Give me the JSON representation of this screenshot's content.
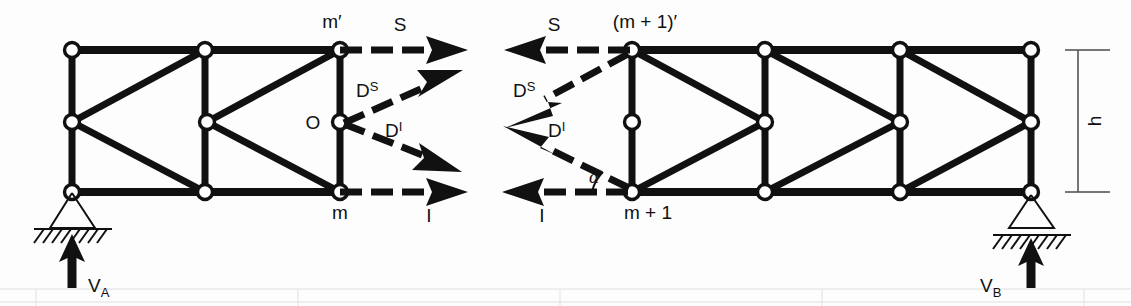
{
  "figure": {
    "type": "truss-free-body-diagram",
    "background_color": "#fdfdfd",
    "ink_color": "#111111"
  },
  "labels": {
    "node_m_top": "m′",
    "node_m_bottom": "m",
    "node_o": "O",
    "node_mp1_top": "(m + 1)′",
    "node_mp1_bottom": "m + 1",
    "force_s_left": "S",
    "force_s_right": "S",
    "force_i_left": "I",
    "force_i_right": "I",
    "force_ds_left": "D",
    "force_ds_left_sup": "S",
    "force_di_left": "D",
    "force_di_left_sup": "I",
    "force_ds_right": "D",
    "force_ds_right_sup": "S",
    "force_di_right": "D",
    "force_di_right_sup": "I",
    "angle_alpha": "α",
    "reaction_a": "V",
    "reaction_a_sub": "A",
    "reaction_b": "V",
    "reaction_b_sub": "B",
    "height_dim": "h"
  },
  "geometry": {
    "left_truss": {
      "top_chord_y": 50,
      "mid_y": 122,
      "bottom_chord_y": 192,
      "panel_x": [
        72,
        205,
        340
      ],
      "top_nodes": [
        [
          72,
          50
        ],
        [
          205,
          50
        ],
        [
          340,
          50
        ]
      ],
      "mid_nodes": [
        [
          72,
          122
        ],
        [
          207,
          122
        ],
        [
          340,
          122
        ]
      ],
      "bottom_nodes": [
        [
          72,
          192
        ],
        [
          205,
          192
        ],
        [
          340,
          192
        ]
      ],
      "diagonals": [
        [
          [
            72,
            122
          ],
          [
            205,
            50
          ]
        ],
        [
          [
            72,
            122
          ],
          [
            205,
            192
          ]
        ],
        [
          [
            207,
            122
          ],
          [
            340,
            50
          ]
        ],
        [
          [
            207,
            122
          ],
          [
            340,
            192
          ]
        ]
      ],
      "verticals": [
        [
          [
            72,
            50
          ],
          [
            72,
            192
          ]
        ],
        [
          [
            205,
            50
          ],
          [
            205,
            192
          ]
        ],
        [
          [
            340,
            50
          ],
          [
            340,
            192
          ]
        ]
      ]
    },
    "right_truss": {
      "top_chord_y": 50,
      "mid_y": 122,
      "bottom_chord_y": 192,
      "panel_x": [
        632,
        765,
        900,
        1031
      ],
      "top_nodes": [
        [
          632,
          50
        ],
        [
          765,
          50
        ],
        [
          900,
          50
        ],
        [
          1031,
          50
        ]
      ],
      "mid_nodes": [
        [
          632,
          122
        ],
        [
          765,
          122
        ],
        [
          900,
          122
        ],
        [
          1031,
          122
        ]
      ],
      "bottom_nodes": [
        [
          632,
          192
        ],
        [
          765,
          192
        ],
        [
          900,
          192
        ],
        [
          1031,
          192
        ]
      ],
      "diagonals": [
        [
          [
            632,
            50
          ],
          [
            765,
            122
          ]
        ],
        [
          [
            632,
            192
          ],
          [
            765,
            122
          ]
        ],
        [
          [
            765,
            50
          ],
          [
            900,
            122
          ]
        ],
        [
          [
            765,
            192
          ],
          [
            900,
            122
          ]
        ],
        [
          [
            900,
            50
          ],
          [
            1031,
            122
          ]
        ],
        [
          [
            900,
            192
          ],
          [
            1031,
            122
          ]
        ]
      ],
      "verticals": [
        [
          [
            632,
            50
          ],
          [
            632,
            192
          ]
        ],
        [
          [
            765,
            50
          ],
          [
            765,
            192
          ]
        ],
        [
          [
            900,
            50
          ],
          [
            900,
            192
          ]
        ],
        [
          [
            1031,
            50
          ],
          [
            1031,
            192
          ]
        ]
      ]
    },
    "supports": {
      "pin_a": {
        "x": 72,
        "y": 192,
        "kind": "pinned-hatched"
      },
      "roller_b": {
        "x": 1031,
        "y": 192,
        "kind": "roller-hatched"
      }
    },
    "height_dimension": {
      "x": 1078,
      "y_top": 50,
      "y_bottom": 192
    }
  },
  "forces": {
    "left_section": [
      {
        "name": "S",
        "from": [
          340,
          50
        ],
        "to": [
          465,
          50
        ],
        "direction": "right",
        "label_pos": [
          398,
          30
        ]
      },
      {
        "name": "D^S",
        "from": [
          345,
          122
        ],
        "to": [
          450,
          72
        ],
        "direction": "up-right",
        "label_pos": [
          362,
          90
        ]
      },
      {
        "name": "D^I",
        "from": [
          345,
          122
        ],
        "to": [
          455,
          170
        ],
        "direction": "down-right",
        "label_pos": [
          392,
          128
        ]
      },
      {
        "name": "I",
        "from": [
          340,
          192
        ],
        "to": [
          465,
          192
        ],
        "direction": "right",
        "label_pos": [
          428,
          216
        ]
      }
    ],
    "right_section": [
      {
        "name": "S",
        "from": [
          630,
          50
        ],
        "to": [
          508,
          50
        ],
        "direction": "left",
        "label_pos": [
          552,
          30
        ]
      },
      {
        "name": "D^S",
        "from": [
          628,
          54
        ],
        "to": [
          505,
          128
        ],
        "direction": "down-left",
        "label_pos": [
          522,
          90
        ]
      },
      {
        "name": "D^I",
        "from": [
          630,
          188
        ],
        "to": [
          504,
          126
        ],
        "direction": "up-left",
        "label_pos": [
          554,
          128
        ]
      },
      {
        "name": "I",
        "from": [
          628,
          192
        ],
        "to": [
          506,
          192
        ],
        "direction": "left",
        "label_pos": [
          540,
          216
        ]
      }
    ]
  },
  "annotations": {
    "alpha_arc_vertex": [
      632,
      192
    ],
    "alpha_label_pos": [
      598,
      180
    ]
  }
}
